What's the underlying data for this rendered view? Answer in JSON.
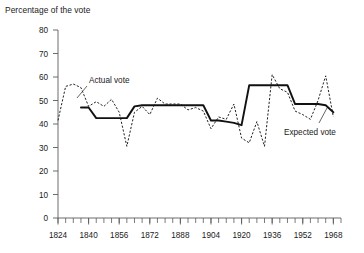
{
  "chart_data": {
    "type": "line",
    "title": "Percentage of the vote",
    "xlabel": "",
    "ylabel": "Percentage of the vote",
    "xlim": [
      1824,
      1972
    ],
    "ylim": [
      0,
      80
    ],
    "yticks": [
      0,
      10,
      20,
      30,
      40,
      50,
      60,
      70,
      80
    ],
    "xticks": [
      1824,
      1840,
      1856,
      1872,
      1888,
      1904,
      1920,
      1936,
      1952,
      1968
    ],
    "xtick_minor_step": 4,
    "grid": false,
    "legend": "annotations",
    "annotations": [
      {
        "text": "Actual vote",
        "series": "Actual vote",
        "x": 1840,
        "y": 59
      },
      {
        "text": "Expected vote",
        "series": "Expected vote",
        "x": 1950,
        "y": 36
      }
    ],
    "series": [
      {
        "name": "Actual vote",
        "style": "dashed",
        "x": [
          1824,
          1828,
          1832,
          1836,
          1840,
          1844,
          1848,
          1852,
          1856,
          1860,
          1864,
          1868,
          1872,
          1876,
          1880,
          1884,
          1888,
          1892,
          1896,
          1900,
          1904,
          1908,
          1912,
          1916,
          1920,
          1924,
          1928,
          1932,
          1936,
          1940,
          1944,
          1948,
          1952,
          1956,
          1960,
          1964,
          1968
        ],
        "values": [
          41.5,
          56.0,
          57.0,
          55.5,
          47.5,
          49.5,
          47.5,
          50.5,
          45.0,
          30.5,
          45.0,
          47.5,
          44.0,
          51.0,
          48.5,
          48.5,
          48.5,
          46.0,
          47.0,
          45.5,
          38.0,
          43.0,
          42.0,
          48.5,
          34.0,
          32.0,
          41.0,
          30.5,
          61.0,
          55.0,
          53.5,
          45.5,
          44.0,
          42.0,
          50.0,
          60.5,
          43.0
        ]
      },
      {
        "name": "Expected vote",
        "style": "solid",
        "x": [
          1836,
          1840,
          1844,
          1848,
          1852,
          1856,
          1860,
          1864,
          1868,
          1872,
          1876,
          1880,
          1884,
          1888,
          1892,
          1896,
          1900,
          1904,
          1908,
          1912,
          1916,
          1920,
          1924,
          1928,
          1932,
          1936,
          1940,
          1944,
          1948,
          1952,
          1956,
          1960,
          1964,
          1968
        ],
        "values": [
          47.0,
          47.0,
          42.5,
          42.5,
          42.5,
          42.5,
          42.5,
          47.5,
          48.0,
          48.0,
          48.0,
          48.0,
          48.0,
          48.0,
          48.0,
          48.0,
          48.0,
          41.5,
          41.5,
          41.0,
          40.5,
          39.5,
          56.5,
          56.5,
          56.5,
          56.5,
          56.5,
          56.5,
          48.5,
          48.5,
          48.5,
          48.5,
          48.0,
          45.0
        ]
      }
    ]
  }
}
